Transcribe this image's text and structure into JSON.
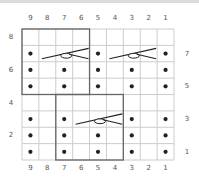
{
  "chart": {
    "columns": [
      "9",
      "8",
      "7",
      "6",
      "5",
      "4",
      "3",
      "2",
      "1"
    ],
    "rows_left_labels": [
      "8",
      "6",
      "4",
      "2"
    ],
    "rows_right_labels": [
      "7",
      "5",
      "3",
      "1"
    ],
    "grid": {
      "cols": 9,
      "rows": 8
    },
    "colors": {
      "grid_line": "#cccccc",
      "outline": "#666666",
      "symbol": "#222222",
      "background": "#ffffff"
    },
    "purl_dots": [
      {
        "row": 7,
        "cols": [
          9,
          5,
          1
        ]
      },
      {
        "row": 6,
        "cols": [
          9,
          7,
          5,
          3,
          1
        ]
      },
      {
        "row": 5,
        "cols": [
          9,
          7,
          5,
          3,
          1
        ]
      },
      {
        "row": 4,
        "cols": []
      },
      {
        "row": 3,
        "cols": [
          9,
          7,
          3,
          1
        ]
      },
      {
        "row": 2,
        "cols": [
          9,
          7,
          5,
          3,
          1
        ]
      },
      {
        "row": 1,
        "cols": [
          9,
          7,
          5,
          3,
          1
        ]
      }
    ],
    "cables": [
      {
        "row": 7,
        "from_col": 8,
        "to_col": 6,
        "type": "cross"
      },
      {
        "row": 7,
        "from_col": 4,
        "to_col": 2,
        "type": "cross"
      },
      {
        "row": 3,
        "from_col": 6,
        "to_col": 4,
        "type": "cross"
      }
    ],
    "repeat_outlines": [
      {
        "cols": [
          9,
          6
        ],
        "rows": [
          8,
          5
        ]
      },
      {
        "cols": [
          7,
          4
        ],
        "rows": [
          4,
          1
        ]
      }
    ],
    "legend": {
      "dot": "purl-symbol",
      "cable": "cable-cross-symbol"
    }
  }
}
